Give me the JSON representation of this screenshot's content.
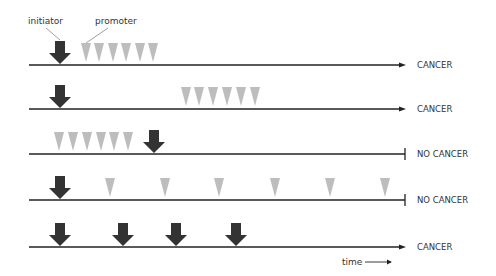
{
  "labels": {
    "initiator": "initiator",
    "promoter": "promoter",
    "time": "time"
  },
  "colors": {
    "initiator": "#333333",
    "promoter": "#bdbdbd",
    "line": "#222222",
    "text": "#333333"
  },
  "rows": [
    {
      "outcome": "CANCER",
      "end": "arrow",
      "initiators": [
        0
      ],
      "promoters": [
        1,
        2,
        3,
        4,
        5,
        6
      ],
      "promoter_spacing": "dense",
      "promoter_start_fraction": 0.155
    },
    {
      "outcome": "CANCER",
      "end": "arrow",
      "initiators": [
        0
      ],
      "promoters": [
        0,
        1,
        2,
        3,
        4,
        5
      ],
      "promoter_spacing": "dense",
      "promoter_start_fraction": 0.415
    },
    {
      "outcome": "NO CANCER",
      "end": "bar",
      "initiators": [
        0.34
      ],
      "promoters": [
        0,
        1,
        2,
        3,
        4,
        5
      ],
      "promoter_spacing": "dense",
      "promoter_start_fraction": 0.09,
      "initiator_after_promoters": true
    },
    {
      "outcome": "NO CANCER",
      "end": "bar",
      "initiators": [
        0
      ],
      "promoters": [
        0,
        1,
        2,
        3,
        4,
        5
      ],
      "promoter_spacing": "sparse"
    },
    {
      "outcome": "CANCER",
      "end": "arrow",
      "initiators": [
        0,
        1,
        2,
        3
      ],
      "promoters": [],
      "initiator_spacing": "irregular"
    }
  ]
}
